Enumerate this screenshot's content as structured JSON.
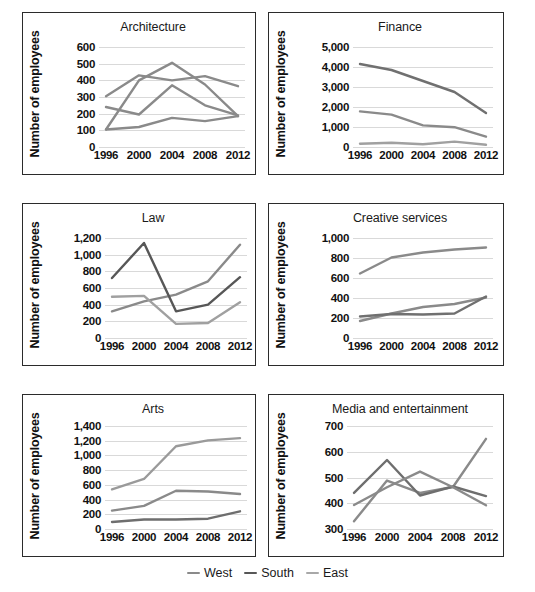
{
  "legend": {
    "items": [
      {
        "label": "West",
        "color": "#8a8a8a"
      },
      {
        "label": "South",
        "color": "#575757"
      },
      {
        "label": "East",
        "color": "#a8a8a8"
      }
    ]
  },
  "axis_label": "Number of employees",
  "chart_data": [
    {
      "type": "line",
      "title": "Architecture",
      "xlabel": "",
      "ylabel": "Number of employees",
      "categories": [
        1996,
        2000,
        2004,
        2008,
        2012
      ],
      "tick_labels": [
        "1996",
        "2000",
        "2004",
        "2008",
        "2012"
      ],
      "yticks": [
        0,
        100,
        200,
        300,
        400,
        500,
        600
      ],
      "ytick_labels": [
        "0",
        "100",
        "200",
        "300",
        "400",
        "500",
        "600"
      ],
      "ylim": [
        0,
        600
      ],
      "grid": true,
      "legend_position": "below-figure",
      "series": [
        {
          "name": "West",
          "color": "#8a8a8a",
          "values": [
            305,
            430,
            400,
            425,
            365
          ]
        },
        {
          "name": "South",
          "color": "#8a8a8a",
          "values": [
            240,
            195,
            370,
            250,
            190
          ]
        },
        {
          "name": "East",
          "color": "#8a8a8a",
          "values": [
            105,
            120,
            175,
            155,
            185
          ]
        }
      ],
      "extra_series": [
        {
          "name": "peak",
          "color": "#8a8a8a",
          "values": [
            105,
            400,
            505,
            375,
            185
          ]
        }
      ]
    },
    {
      "type": "line",
      "title": "Finance",
      "xlabel": "",
      "ylabel": "Number of employees",
      "categories": [
        1996,
        2000,
        2004,
        2008,
        2012
      ],
      "tick_labels": [
        "1996",
        "2000",
        "2004",
        "2008",
        "2012"
      ],
      "yticks": [
        0,
        1000,
        2000,
        3000,
        4000,
        5000
      ],
      "ytick_labels": [
        "0",
        "1,000",
        "2,000",
        "3,000",
        "4,000",
        "5,000"
      ],
      "ylim": [
        0,
        5000
      ],
      "grid": true,
      "legend_position": "below-figure",
      "series": [
        {
          "name": "West",
          "color": "#707070",
          "values": [
            4150,
            3850,
            3300,
            2750,
            1700
          ]
        },
        {
          "name": "South",
          "color": "#8a8a8a",
          "values": [
            1780,
            1620,
            1080,
            990,
            520
          ]
        },
        {
          "name": "East",
          "color": "#a0a0a0",
          "values": [
            160,
            215,
            135,
            270,
            110
          ]
        }
      ]
    },
    {
      "type": "line",
      "title": "Law",
      "xlabel": "",
      "ylabel": "Number of employees",
      "categories": [
        1996,
        2000,
        2004,
        2008,
        2012
      ],
      "tick_labels": [
        "1996",
        "2000",
        "2004",
        "2008",
        "2012"
      ],
      "yticks": [
        0,
        200,
        400,
        600,
        800,
        1000,
        1200
      ],
      "ytick_labels": [
        "0",
        "200",
        "400",
        "600",
        "800",
        "1,000",
        "1,200"
      ],
      "ylim": [
        0,
        1200
      ],
      "grid": true,
      "legend_position": "below-figure",
      "series": [
        {
          "name": "West",
          "color": "#8a8a8a",
          "values": [
            320,
            440,
            520,
            680,
            1120
          ]
        },
        {
          "name": "South",
          "color": "#575757",
          "values": [
            720,
            1140,
            320,
            400,
            730
          ]
        },
        {
          "name": "East",
          "color": "#a0a0a0",
          "values": [
            495,
            505,
            170,
            180,
            430
          ]
        }
      ]
    },
    {
      "type": "line",
      "title": "Creative services",
      "xlabel": "",
      "ylabel": "Number of employees",
      "categories": [
        1996,
        2000,
        2004,
        2008,
        2012
      ],
      "tick_labels": [
        "1996",
        "2000",
        "2004",
        "2008",
        "2012"
      ],
      "yticks": [
        0,
        200,
        400,
        600,
        800,
        1000
      ],
      "ytick_labels": [
        "0",
        "200",
        "400",
        "600",
        "800",
        "1,000"
      ],
      "ylim": [
        0,
        1000
      ],
      "grid": true,
      "legend_position": "below-figure",
      "series": [
        {
          "name": "West",
          "color": "#8a8a8a",
          "values": [
            645,
            805,
            855,
            885,
            905
          ]
        },
        {
          "name": "South",
          "color": "#8a8a8a",
          "values": [
            170,
            245,
            310,
            340,
            405
          ]
        },
        {
          "name": "East",
          "color": "#707070",
          "values": [
            215,
            240,
            235,
            245,
            415
          ]
        }
      ]
    },
    {
      "type": "line",
      "title": "Arts",
      "xlabel": "",
      "ylabel": "Number of employees",
      "categories": [
        1996,
        2000,
        2004,
        2008,
        2012
      ],
      "tick_labels": [
        "1996",
        "2000",
        "2004",
        "2008",
        "2012"
      ],
      "yticks": [
        0,
        200,
        400,
        600,
        800,
        1000,
        1200,
        1400
      ],
      "ytick_labels": [
        "0",
        "200",
        "400",
        "600",
        "800",
        "1,000",
        "1,200",
        "1,400"
      ],
      "ylim": [
        0,
        1400
      ],
      "grid": true,
      "legend_position": "below-figure",
      "series": [
        {
          "name": "West",
          "color": "#9a9a9a",
          "values": [
            540,
            680,
            1125,
            1205,
            1235
          ]
        },
        {
          "name": "South",
          "color": "#8a8a8a",
          "values": [
            250,
            315,
            520,
            510,
            475
          ]
        },
        {
          "name": "East",
          "color": "#6e6e6e",
          "values": [
            95,
            130,
            130,
            140,
            240
          ]
        }
      ]
    },
    {
      "type": "line",
      "title": "Media and entertainment",
      "xlabel": "",
      "ylabel": "Number of employees",
      "categories": [
        1996,
        2000,
        2004,
        2008,
        2012
      ],
      "tick_labels": [
        "1996",
        "2000",
        "2004",
        "2008",
        "2012"
      ],
      "yticks": [
        300,
        400,
        500,
        600,
        700
      ],
      "ytick_labels": [
        "300",
        "400",
        "500",
        "600",
        "700"
      ],
      "ylim": [
        300,
        700
      ],
      "grid": true,
      "legend_position": "below-figure",
      "series": [
        {
          "name": "West",
          "color": "#8a8a8a",
          "values": [
            330,
            488,
            440,
            463,
            650
          ]
        },
        {
          "name": "South",
          "color": "#6e6e6e",
          "values": [
            440,
            568,
            430,
            465,
            428
          ]
        },
        {
          "name": "East",
          "color": "#8a8a8a",
          "values": [
            393,
            462,
            523,
            462,
            392
          ]
        }
      ]
    }
  ]
}
